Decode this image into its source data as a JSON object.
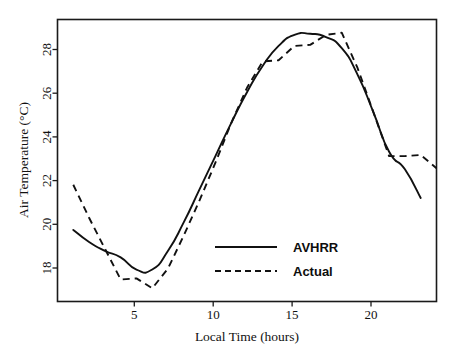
{
  "chart_data": {
    "type": "line",
    "title": "",
    "xlabel": "Local Time (hours)",
    "ylabel": "Air Temperature (°C)",
    "xlim": [
      0,
      24
    ],
    "ylim": [
      16.8,
      29.6
    ],
    "xticks": [
      5,
      10,
      15,
      20
    ],
    "yticks": [
      18,
      20,
      22,
      24,
      26,
      28
    ],
    "xtick_labels": [
      "5",
      "10",
      "15",
      "20"
    ],
    "ytick_labels": [
      "18",
      "20",
      "22",
      "24",
      "26",
      "28"
    ],
    "grid": false,
    "legend_position": "center-right-inside",
    "x": [
      1,
      2,
      3,
      4,
      5,
      6,
      7,
      8,
      9,
      10,
      11,
      12,
      13,
      14,
      15,
      16,
      17,
      18,
      19,
      20,
      21,
      22,
      23,
      24
    ],
    "series": [
      {
        "name": "AVHRR",
        "style": "solid",
        "values": [
          20.05,
          19.5,
          19.1,
          18.8,
          18.25,
          18.25,
          19.1,
          20.4,
          21.9,
          23.4,
          24.9,
          26.3,
          27.5,
          28.4,
          28.9,
          28.95,
          28.8,
          28.3,
          27.1,
          25.4,
          23.6,
          22.8,
          21.5,
          null
        ]
      },
      {
        "name": "Actual",
        "style": "dashed",
        "values": [
          22.1,
          20.6,
          19.2,
          17.8,
          17.85,
          17.4,
          18.3,
          19.8,
          21.4,
          23.1,
          24.9,
          26.5,
          27.7,
          27.75,
          28.4,
          28.45,
          28.9,
          29.0,
          27.4,
          25.4,
          23.4,
          23.4,
          23.45,
          22.85
        ]
      }
    ],
    "annotations": [],
    "notes": {
      "min_avhrr": 18.25,
      "min_actual": 17.4,
      "max_avhrr": 28.95,
      "max_actual": 29.0
    }
  },
  "legend": {
    "entries": [
      {
        "label": "AVHRR",
        "style": "solid"
      },
      {
        "label": "Actual",
        "style": "dashed"
      }
    ]
  },
  "axes": {
    "x_title": "Local Time (hours)",
    "y_title": "Air Temperature (°C)",
    "x_tick_labels": [
      "5",
      "10",
      "15",
      "20"
    ],
    "y_tick_labels": [
      "18",
      "20",
      "22",
      "24",
      "26",
      "28"
    ]
  },
  "colors": {
    "line": "#111111",
    "frame": "#1a1a1a",
    "background": "#ffffff",
    "text": "#111111"
  }
}
